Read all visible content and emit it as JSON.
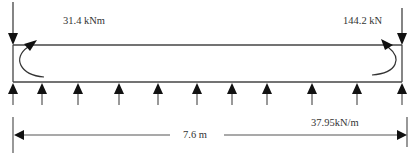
{
  "diagram": {
    "type": "beam-loading-diagram",
    "labels": {
      "moment": "31.4 kNm",
      "point_load": "144.2 kN",
      "span": "7.6 m",
      "distributed_load": "37.95kN/m"
    },
    "beam": {
      "x_left": 13,
      "x_right": 402,
      "y_top": 45,
      "y_bottom": 82
    },
    "distributed_arrows_x": [
      13,
      42,
      78,
      119,
      158,
      197,
      232,
      267,
      312,
      357,
      402
    ],
    "colors": {
      "stroke": "#333333",
      "text": "#333333",
      "background": "#ffffff"
    }
  }
}
